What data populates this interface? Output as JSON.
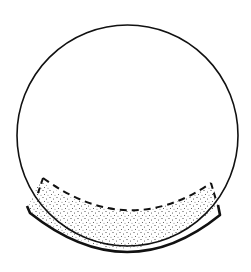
{
  "diagram": {
    "colors": {
      "background": "#ffffff",
      "stroke": "#111111",
      "stipple": "#333333"
    },
    "sphere": {
      "cx": 127.5,
      "cy": 135.5,
      "r": 110.5
    },
    "elements": [
      {
        "name": "sphere-outline",
        "style": "solid thin"
      },
      {
        "name": "stippled-layer",
        "style": "dotted fill"
      },
      {
        "name": "dashed-upper-boundary",
        "style": "dashed"
      },
      {
        "name": "outer-support-arc",
        "style": "solid thick"
      }
    ]
  }
}
